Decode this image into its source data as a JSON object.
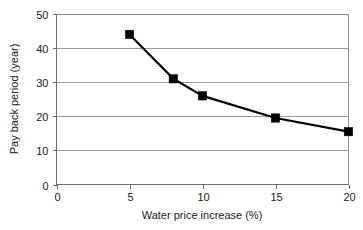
{
  "chart_data": {
    "type": "line",
    "title": "",
    "xlabel": "Water price increase (%)",
    "ylabel": "Pay back period (year)",
    "xlim": [
      0,
      20
    ],
    "ylim": [
      0,
      50
    ],
    "xticks": [
      0,
      5,
      10,
      15,
      20
    ],
    "yticks": [
      0,
      10,
      20,
      30,
      40,
      50
    ],
    "xtick_labels": [
      "0",
      "5",
      "10",
      "15",
      "20"
    ],
    "ytick_labels": [
      "0",
      "10",
      "20",
      "30",
      "40",
      "50"
    ],
    "grid": "horizontal",
    "legend": "none",
    "series": [
      {
        "name": "Pay back period",
        "marker": "square",
        "marker_color": "#000000",
        "line_color": "#000000",
        "x": [
          5,
          8,
          10,
          15,
          20
        ],
        "values": [
          44,
          31,
          26,
          19.5,
          15.5
        ],
        "points": [
          {
            "x": 5,
            "y": 44
          },
          {
            "x": 8,
            "y": 31
          },
          {
            "x": 10,
            "y": 26
          },
          {
            "x": 15,
            "y": 19.5
          },
          {
            "x": 20,
            "y": 15.5
          }
        ]
      }
    ],
    "colors": {
      "background": "#ffffff",
      "grid": "#9a9a9a",
      "axis": "#6b6b6b",
      "series": "#000000",
      "text": "#1a1a1a"
    }
  }
}
